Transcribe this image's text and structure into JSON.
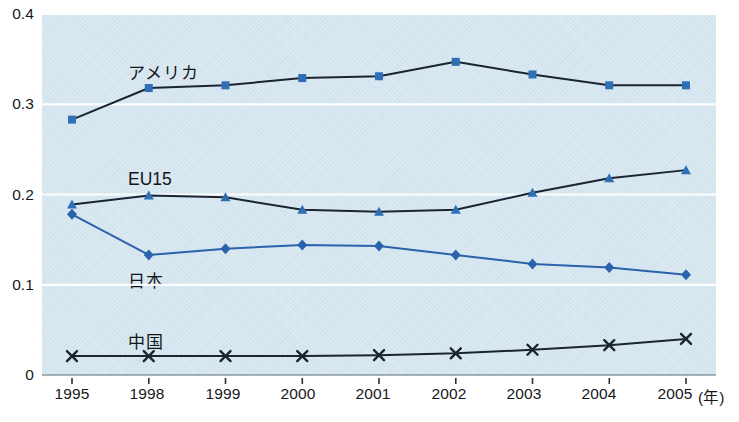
{
  "chart_data": {
    "type": "line",
    "title": "",
    "subtitle": "",
    "xlabel": "(年)",
    "ylabel": "",
    "categories": [
      "1995",
      "1998",
      "1999",
      "2000",
      "2001",
      "2002",
      "2003",
      "2004",
      "2005"
    ],
    "x_unit_note": "(年)",
    "xlim": [
      0,
      8
    ],
    "ylim": [
      0,
      0.4
    ],
    "yticks": [
      "0",
      "0.1",
      "0.2",
      "0.3",
      "0.4"
    ],
    "ytick_values": [
      0,
      0.1,
      0.2,
      0.3,
      0.4
    ],
    "grid": "horizontal-white-gridlines",
    "legend": "inline-labels",
    "plot_background": "#d7e7f1",
    "series": [
      {
        "name": "アメリカ",
        "marker": "square",
        "line_color": "#1b2430",
        "marker_color": "#2f6fb5",
        "label_x": 128,
        "label_y": 59,
        "values": [
          0.283,
          0.318,
          0.321,
          0.329,
          0.331,
          0.347,
          0.333,
          0.321,
          0.321
        ]
      },
      {
        "name": "EU15",
        "marker": "triangle",
        "line_color": "#1b2430",
        "marker_color": "#2f6fb5",
        "label_x": 128,
        "label_y": 169,
        "values": [
          0.189,
          0.199,
          0.197,
          0.183,
          0.181,
          0.183,
          0.202,
          0.218,
          0.227
        ]
      },
      {
        "name": "日本",
        "marker": "diamond",
        "line_color": "#2a62ab",
        "marker_color": "#2a62ab",
        "label_x": 128,
        "label_y": 267,
        "values": [
          0.178,
          0.133,
          0.14,
          0.144,
          0.143,
          0.133,
          0.123,
          0.119,
          0.111
        ]
      },
      {
        "name": "中国",
        "marker": "cross",
        "line_color": "#1b2430",
        "marker_color": "#1b2430",
        "label_x": 128,
        "label_y": 328,
        "values": [
          0.021,
          0.021,
          0.021,
          0.021,
          0.022,
          0.024,
          0.028,
          0.033,
          0.04
        ]
      }
    ]
  },
  "axes": {
    "y_tick_labels": [
      "0.4",
      "0.3",
      "0.2",
      "0.1",
      "0"
    ],
    "x_tick_labels": [
      "1995",
      "1998",
      "1999",
      "2000",
      "2001",
      "2002",
      "2003",
      "2004",
      "2005"
    ],
    "x_axis_unit": "(年)"
  }
}
